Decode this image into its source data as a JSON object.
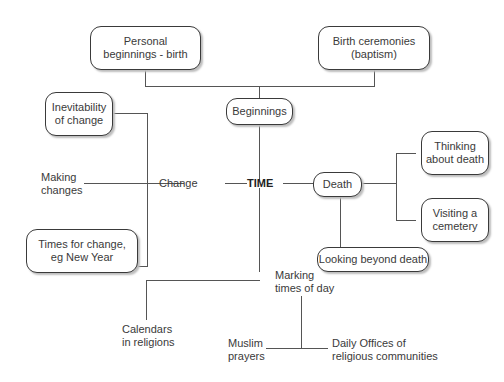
{
  "diagram": {
    "type": "mind-map",
    "center": "TIME",
    "nodes": {
      "personal_beginnings": "Personal beginnings - birth",
      "personal_beginnings_l1": "Personal",
      "personal_beginnings_l2": "beginnings - birth",
      "birth_ceremonies_l1": "Birth ceremonies",
      "birth_ceremonies_l2": "(baptism)",
      "beginnings": "Beginnings",
      "inevitability_l1": "Inevitability",
      "inevitability_l2": "of change",
      "making_changes_l1": "Making",
      "making_changes_l2": "changes",
      "change": "Change",
      "times_for_change_l1": "Times for change,",
      "times_for_change_l2": "eg New Year",
      "death": "Death",
      "thinking_l1": "Thinking",
      "thinking_l2": "about death",
      "visiting_l1": "Visiting a",
      "visiting_l2": "cemetery",
      "looking_beyond": "Looking beyond death",
      "marking_l1": "Marking",
      "marking_l2": "times of day",
      "calendars_l1": "Calendars",
      "calendars_l2": "in religions",
      "muslim_l1": "Muslim",
      "muslim_l2": "prayers",
      "daily_offices_l1": "Daily Offices of",
      "daily_offices_l2": "religious communities"
    },
    "edges": [
      [
        "TIME",
        "Beginnings"
      ],
      [
        "Beginnings",
        "Personal beginnings - birth"
      ],
      [
        "Beginnings",
        "Birth ceremonies (baptism)"
      ],
      [
        "TIME",
        "Change"
      ],
      [
        "Change",
        "Inevitability of change"
      ],
      [
        "Change",
        "Making changes"
      ],
      [
        "Change",
        "Times for change, eg New Year"
      ],
      [
        "TIME",
        "Death"
      ],
      [
        "Death",
        "Thinking about death"
      ],
      [
        "Death",
        "Visiting a cemetery"
      ],
      [
        "Death",
        "Looking beyond death"
      ],
      [
        "TIME",
        "Marking times of day"
      ],
      [
        "TIME",
        "Calendars in religions"
      ],
      [
        "Marking times of day",
        "Muslim prayers"
      ],
      [
        "Marking times of day",
        "Daily Offices of religious communities"
      ]
    ]
  }
}
